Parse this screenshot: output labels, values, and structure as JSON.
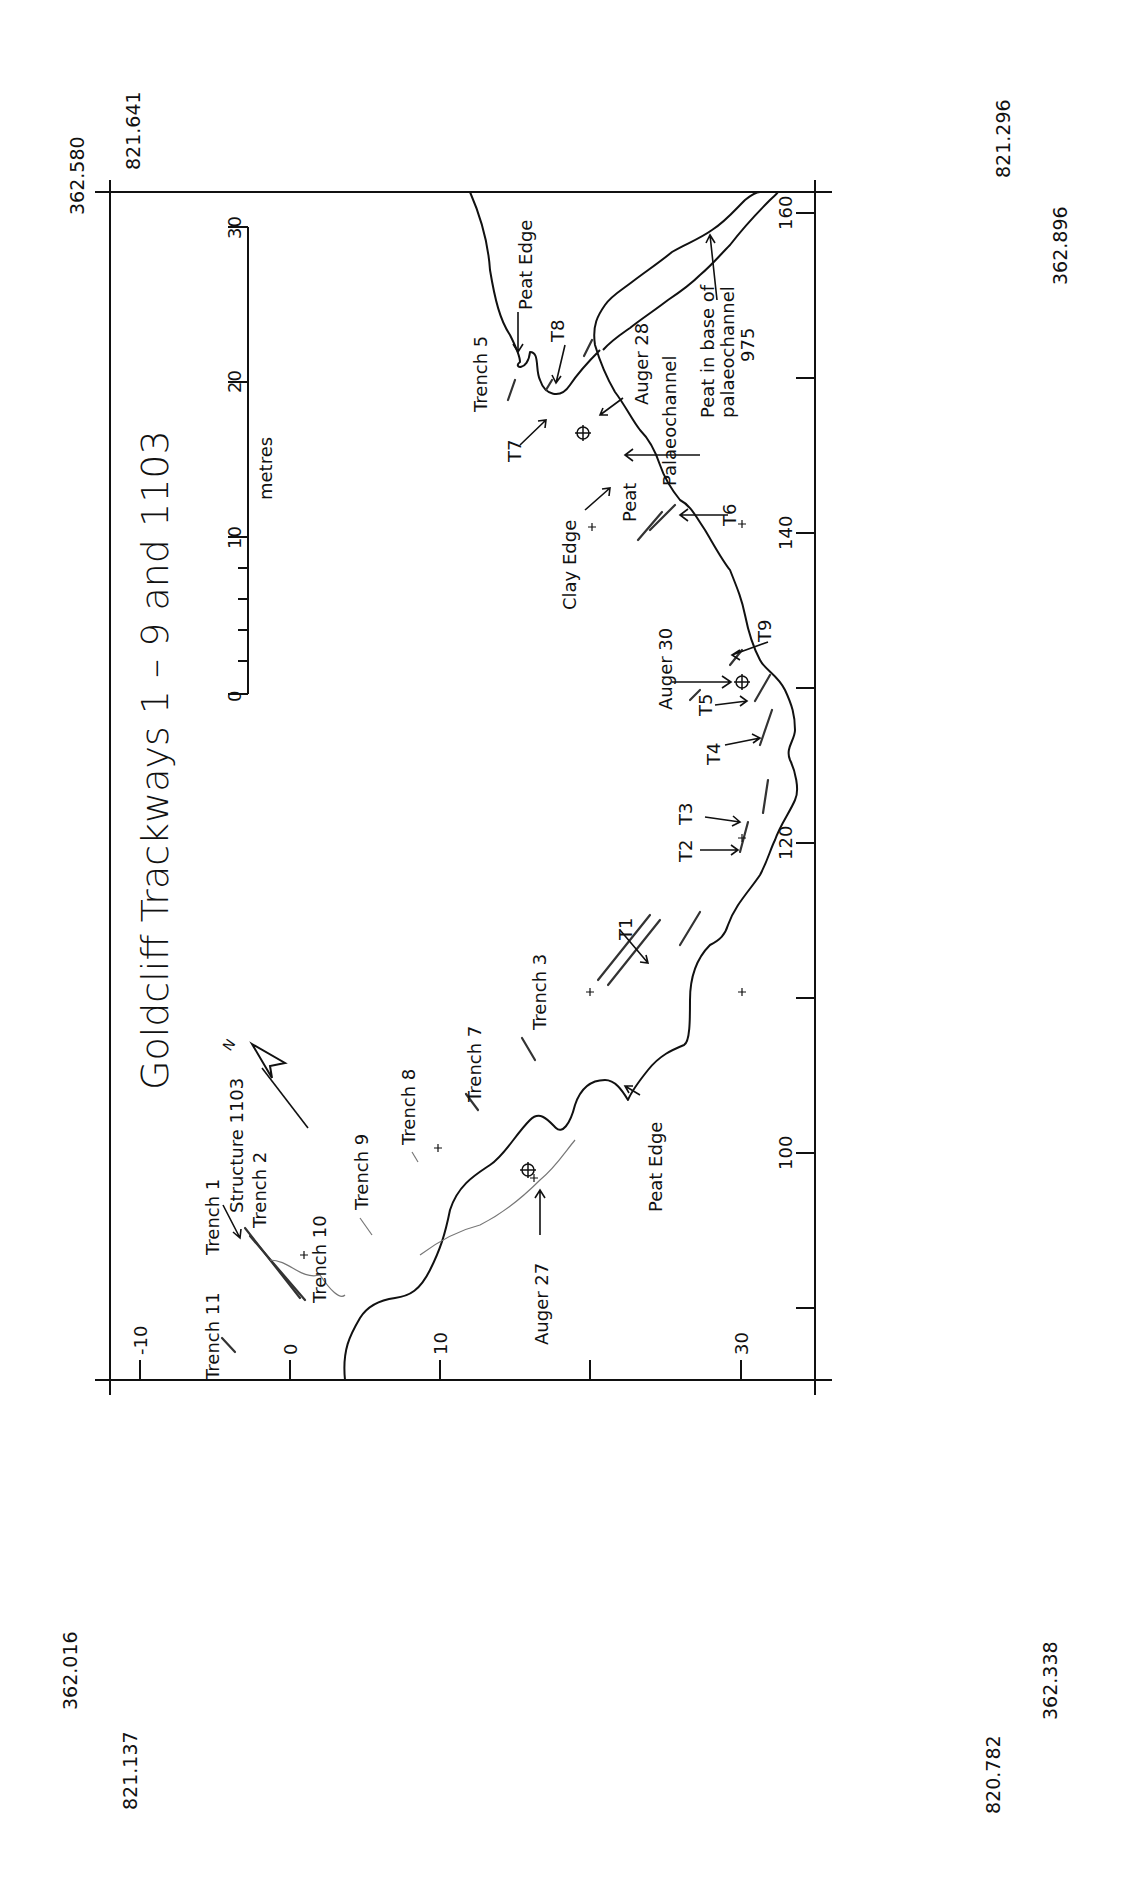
{
  "title": "Goldcliff Trackways 1 – 9 and 1103",
  "scale_bar": {
    "unit_label": "metres",
    "ticks": [
      "0",
      "10",
      "20",
      "30"
    ]
  },
  "north_arrow": {
    "label": "N"
  },
  "corner_coords": {
    "top_left_easting": "362.580",
    "top_left_northing": "821.641",
    "top_right_northing": "821.296",
    "top_right_easting": "362.896",
    "bottom_left_easting": "362.016",
    "bottom_left_northing": "821.137",
    "bottom_right_northing": "820.782",
    "bottom_right_easting": "362.338"
  },
  "grid_axis_left": {
    "ticks": [
      "-10",
      "0",
      "10",
      "30"
    ]
  },
  "grid_axis_right": {
    "ticks": [
      "100",
      "120",
      "140",
      "160"
    ]
  },
  "labels": {
    "trench_1": "Trench  1",
    "structure_1103": "Structure  1103",
    "trench_2": "Trench  2",
    "trench_10": "Trench  10",
    "trench_11": "Trench  11",
    "trench_9": "Trench  9",
    "trench_8": "Trench  8",
    "trench_7": "Trench  7",
    "trench_3": "Trench  3",
    "trench_5": "Trench  5",
    "auger_27": "Auger  27",
    "auger_28": "Auger  28",
    "auger_30": "Auger  30",
    "peat_edge_top": "Peat  Edge",
    "peat_edge_bottom": "Peat  Edge",
    "clay_edge": "Clay  Edge",
    "peat": "Peat",
    "palaeochannel": "Palaeochannel",
    "peat_base_1": "Peat  in  base  of",
    "peat_base_2": "palaeochannel",
    "peat_base_3": "975",
    "t1": "T1",
    "t2": "T2",
    "t3": "T3",
    "t4": "T4",
    "t5": "T5",
    "t6": "T6",
    "t7": "T7",
    "t8": "T8",
    "t9": "T9"
  }
}
